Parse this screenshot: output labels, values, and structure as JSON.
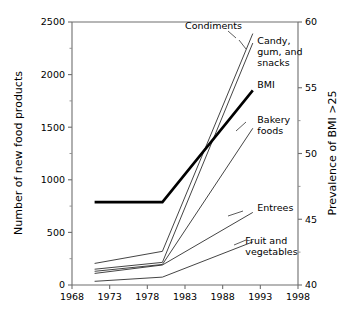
{
  "chart_data": {
    "type": "line",
    "title": "",
    "xlabel": "",
    "ylabel": "Number of new food products",
    "y2label": "Prevalence of BMI >25",
    "xlim": [
      1968,
      1998
    ],
    "ylim": [
      0,
      2500
    ],
    "y2lim": [
      40,
      60
    ],
    "grid": false,
    "legend_position": "inline-labels",
    "x_ticks": [
      "1968",
      "1973",
      "1978",
      "1983",
      "1988",
      "1993",
      "1998"
    ],
    "x_tick_values": [
      1968,
      1973,
      1978,
      1983,
      1988,
      1993,
      1998
    ],
    "y_ticks": [
      "0",
      "500",
      "1000",
      "1500",
      "2000",
      "2500"
    ],
    "y_tick_values": [
      0,
      500,
      1000,
      1500,
      2000,
      2500
    ],
    "y_minor_values": [
      250,
      750,
      1250,
      1750,
      2250
    ],
    "y2_ticks": [
      "40",
      "45",
      "50",
      "55",
      "60"
    ],
    "y2_tick_values": [
      40,
      45,
      50,
      55,
      60
    ],
    "y2_minor_values": [
      42.5,
      47.5,
      52.5,
      57.5
    ],
    "series": [
      {
        "name": "Condiments",
        "axis": "left",
        "style": "thin",
        "x": [
          1971,
          1980,
          1992
        ],
        "values": [
          205,
          320,
          2390
        ],
        "label": "Condiments",
        "label_x": 1983.0,
        "label_y": 2430
      },
      {
        "name": "Candy, gum, and snacks",
        "axis": "left",
        "style": "thin",
        "x": [
          1971,
          1980,
          1992
        ],
        "values": [
          150,
          215,
          2300
        ],
        "label": "Candy,\ngum, and\nsnacks",
        "label_lines": [
          "Candy,",
          "gum, and",
          "snacks"
        ],
        "label_x": 1992.6,
        "label_y": 2290
      },
      {
        "name": "BMI",
        "axis": "right",
        "style": "thick",
        "x": [
          1971,
          1980,
          1992
        ],
        "values": [
          46.3,
          46.3,
          54.8
        ],
        "values_left_scale": [
          780,
          780,
          1845
        ],
        "label": "BMI",
        "label_x": 1992.6,
        "label_y": 1870
      },
      {
        "name": "Bakery foods",
        "axis": "left",
        "style": "thin",
        "x": [
          1971,
          1980,
          1992
        ],
        "values": [
          130,
          195,
          1490
        ],
        "label": "Bakery\nfoods",
        "label_lines": [
          "Bakery",
          "foods"
        ],
        "label_x": 1992.6,
        "label_y": 1540
      },
      {
        "name": "Entrees",
        "axis": "left",
        "style": "thin",
        "x": [
          1971,
          1980,
          1992
        ],
        "values": [
          110,
          190,
          690
        ],
        "label": "Entrees",
        "label_x": 1992.6,
        "label_y": 700
      },
      {
        "name": "Fruit and vegetables",
        "axis": "left",
        "style": "thin",
        "x": [
          1971,
          1980,
          1992
        ],
        "values": [
          35,
          75,
          410
        ],
        "label": "Fruit and\nvegetables",
        "label_lines": [
          "Fruit and",
          "vegetables"
        ],
        "label_x": 1991.0,
        "label_y": 390
      }
    ]
  },
  "colors": {
    "background": "#ffffff",
    "axis": "#6e6e6e",
    "series_thin": "#222222",
    "series_thick": "#000000",
    "text": "#000000"
  }
}
